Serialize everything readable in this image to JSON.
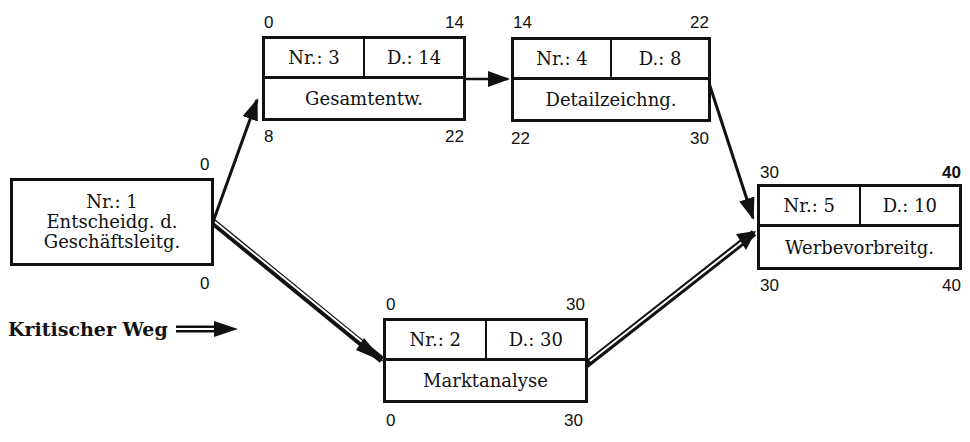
{
  "diagram": {
    "type": "network-plan",
    "nodes": [
      {
        "id": 1,
        "label_nr": "Nr.: 1",
        "lines": [
          "Entscheidg. d.",
          "Geschäftsleitg."
        ],
        "top_right": "0",
        "bottom_right": "0"
      },
      {
        "id": 2,
        "label_nr": "Nr.: 2",
        "label_d": "D.: 30",
        "name": "Marktanalyse",
        "tl": "0",
        "tr": "30",
        "bl": "0",
        "br": "30"
      },
      {
        "id": 3,
        "label_nr": "Nr.: 3",
        "label_d": "D.: 14",
        "name": "Gesamtentw.",
        "tl": "0",
        "tr": "14",
        "bl": "8",
        "br": "22"
      },
      {
        "id": 4,
        "label_nr": "Nr.: 4",
        "label_d": "D.: 8",
        "name": "Detailzeichng.",
        "tl": "14",
        "tr": "22",
        "bl": "22",
        "br": "30"
      },
      {
        "id": 5,
        "label_nr": "Nr.: 5",
        "label_d": "D.: 10",
        "name": "Werbevorbreitg.",
        "tl": "30",
        "tr": "40",
        "bl": "30",
        "br": "40"
      }
    ],
    "edges": [
      {
        "from": 1,
        "to": 3,
        "critical": false
      },
      {
        "from": 3,
        "to": 4,
        "critical": false
      },
      {
        "from": 4,
        "to": 5,
        "critical": false
      },
      {
        "from": 1,
        "to": 2,
        "critical": true
      },
      {
        "from": 2,
        "to": 5,
        "critical": true
      }
    ],
    "legend": {
      "label": "Kritischer Weg"
    }
  }
}
